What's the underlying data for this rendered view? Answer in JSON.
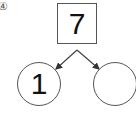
{
  "problem_label": "④",
  "top_box": {
    "value": "7"
  },
  "left_circle": {
    "value": "1"
  },
  "right_circle": {
    "value": ""
  }
}
